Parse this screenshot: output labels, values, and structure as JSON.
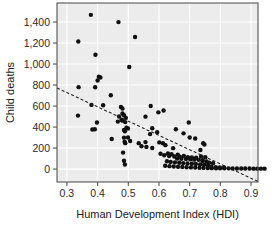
{
  "chart_data": {
    "type": "scatter",
    "title": "",
    "xlabel": "Human Development Index (HDI)",
    "ylabel": "Child deaths",
    "xlim": [
      0.2677,
      0.9226
    ],
    "ylim": [
      -123,
      1581
    ],
    "xticks": [
      0.3,
      0.4,
      0.5,
      0.6,
      0.7,
      0.8,
      0.9
    ],
    "xtick_labels": [
      "0.3",
      "0.4",
      "0.5",
      "0.6",
      "0.7",
      "0.8",
      "0.9"
    ],
    "yticks": [
      0,
      200,
      400,
      600,
      800,
      1000,
      1200,
      1400
    ],
    "ytick_labels": [
      "0",
      "200",
      "400",
      "600",
      "800",
      "1,000",
      "1,200",
      "1,400"
    ],
    "grid": true,
    "grid_color": "#ffffff",
    "plot_background": "#ececec",
    "frame_color": "#555555",
    "point_color": "#101010",
    "point_radius": 2.2,
    "legend": null,
    "trendline": {
      "style": "dashed",
      "color": "#222222",
      "x_start": 0.2677,
      "y_start": 772,
      "x_end": 0.9226,
      "y_end": -118
    },
    "points": [
      [
        0.378,
        1468
      ],
      [
        0.468,
        1399
      ],
      [
        0.337,
        1215
      ],
      [
        0.522,
        1258
      ],
      [
        0.393,
        1088
      ],
      [
        0.503,
        972
      ],
      [
        0.404,
        880
      ],
      [
        0.409,
        872
      ],
      [
        0.4,
        843
      ],
      [
        0.338,
        780
      ],
      [
        0.392,
        779
      ],
      [
        0.443,
        703
      ],
      [
        0.38,
        611
      ],
      [
        0.418,
        608
      ],
      [
        0.573,
        601
      ],
      [
        0.476,
        592
      ],
      [
        0.481,
        576
      ],
      [
        0.615,
        557
      ],
      [
        0.598,
        540
      ],
      [
        0.481,
        529
      ],
      [
        0.336,
        509
      ],
      [
        0.486,
        512
      ],
      [
        0.47,
        501
      ],
      [
        0.556,
        499
      ],
      [
        0.492,
        487
      ],
      [
        0.478,
        470
      ],
      [
        0.481,
        461
      ],
      [
        0.466,
        452
      ],
      [
        0.49,
        447
      ],
      [
        0.697,
        443
      ],
      [
        0.398,
        444
      ],
      [
        0.391,
        379
      ],
      [
        0.383,
        377
      ],
      [
        0.494,
        393
      ],
      [
        0.499,
        386
      ],
      [
        0.486,
        373
      ],
      [
        0.489,
        360
      ],
      [
        0.578,
        389
      ],
      [
        0.594,
        351
      ],
      [
        0.655,
        379
      ],
      [
        0.68,
        340
      ],
      [
        0.571,
        333
      ],
      [
        0.499,
        301
      ],
      [
        0.486,
        299
      ],
      [
        0.446,
        287
      ],
      [
        0.7,
        301
      ],
      [
        0.718,
        291
      ],
      [
        0.506,
        268
      ],
      [
        0.488,
        259
      ],
      [
        0.49,
        247
      ],
      [
        0.534,
        247
      ],
      [
        0.556,
        257
      ],
      [
        0.601,
        254
      ],
      [
        0.613,
        246
      ],
      [
        0.744,
        247
      ],
      [
        0.748,
        234
      ],
      [
        0.621,
        228
      ],
      [
        0.543,
        217
      ],
      [
        0.559,
        211
      ],
      [
        0.578,
        200
      ],
      [
        0.646,
        199
      ],
      [
        0.735,
        182
      ],
      [
        0.483,
        157
      ],
      [
        0.486,
        79
      ],
      [
        0.489,
        44
      ],
      [
        0.605,
        146
      ],
      [
        0.629,
        148
      ],
      [
        0.641,
        141
      ],
      [
        0.661,
        138
      ],
      [
        0.617,
        131
      ],
      [
        0.633,
        124
      ],
      [
        0.65,
        120
      ],
      [
        0.668,
        118
      ],
      [
        0.681,
        126
      ],
      [
        0.694,
        114
      ],
      [
        0.707,
        111
      ],
      [
        0.721,
        108
      ],
      [
        0.659,
        101
      ],
      [
        0.673,
        98
      ],
      [
        0.688,
        96
      ],
      [
        0.702,
        93
      ],
      [
        0.715,
        90
      ],
      [
        0.729,
        88
      ],
      [
        0.742,
        85
      ],
      [
        0.737,
        120
      ],
      [
        0.751,
        112
      ],
      [
        0.626,
        74
      ],
      [
        0.638,
        68
      ],
      [
        0.652,
        64
      ],
      [
        0.666,
        60
      ],
      [
        0.679,
        57
      ],
      [
        0.693,
        54
      ],
      [
        0.707,
        51
      ],
      [
        0.72,
        48
      ],
      [
        0.734,
        45
      ],
      [
        0.747,
        42
      ],
      [
        0.76,
        39
      ],
      [
        0.62,
        31
      ],
      [
        0.634,
        28
      ],
      [
        0.648,
        25
      ],
      [
        0.662,
        22
      ],
      [
        0.676,
        20
      ],
      [
        0.69,
        18
      ],
      [
        0.704,
        16
      ],
      [
        0.718,
        14
      ],
      [
        0.732,
        12
      ],
      [
        0.745,
        11
      ],
      [
        0.759,
        10
      ],
      [
        0.772,
        9
      ],
      [
        0.786,
        8
      ],
      [
        0.799,
        8
      ],
      [
        0.813,
        7
      ],
      [
        0.827,
        7
      ],
      [
        0.84,
        6
      ],
      [
        0.854,
        6
      ],
      [
        0.868,
        5
      ],
      [
        0.881,
        5
      ],
      [
        0.895,
        5
      ],
      [
        0.908,
        4
      ],
      [
        0.92,
        4
      ],
      [
        0.932,
        4
      ],
      [
        0.944,
        4
      ],
      [
        0.771,
        20
      ],
      [
        0.785,
        18
      ],
      [
        0.798,
        16
      ],
      [
        0.812,
        15
      ],
      [
        0.763,
        60
      ],
      [
        0.776,
        55
      ],
      [
        0.755,
        72
      ],
      [
        0.742,
        78
      ]
    ]
  },
  "axes": {
    "xlabel": "Human Development Index (HDI)",
    "ylabel": "Child deaths"
  }
}
